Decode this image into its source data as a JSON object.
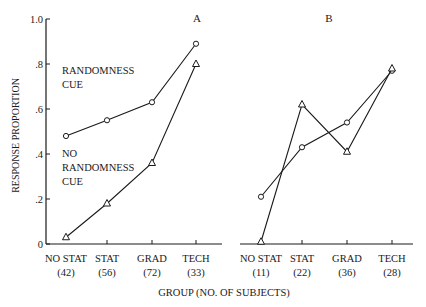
{
  "chart_data": [
    {
      "type": "line",
      "panel_label": "A",
      "categories": [
        "NO STAT",
        "STAT",
        "GRAD",
        "TECH"
      ],
      "category_counts": [
        "(42)",
        "(56)",
        "(72)",
        "(33)"
      ],
      "series": [
        {
          "name": "RANDOMNESS CUE",
          "marker": "circle",
          "values": [
            0.48,
            0.55,
            0.63,
            0.89
          ]
        },
        {
          "name": "NO RANDOMNESS CUE",
          "marker": "triangle",
          "values": [
            0.03,
            0.18,
            0.36,
            0.8
          ]
        }
      ],
      "ylabel": "RESPONSE PROPORTION",
      "yticks": [
        "0",
        ".2",
        ".4",
        ".6",
        ".8",
        "1.0"
      ],
      "ylim": [
        0,
        1.0
      ],
      "grid": false,
      "annotations": [
        {
          "text": [
            "RANDOMNESS",
            "CUE"
          ]
        },
        {
          "text": [
            "NO",
            "RANDOMNESS",
            "CUE"
          ]
        }
      ]
    },
    {
      "type": "line",
      "panel_label": "B",
      "categories": [
        "NO STAT",
        "STAT",
        "GRAD",
        "TECH"
      ],
      "category_counts": [
        "(11)",
        "(22)",
        "(36)",
        "(28)"
      ],
      "series": [
        {
          "name": "RANDOMNESS CUE",
          "marker": "circle",
          "values": [
            0.21,
            0.43,
            0.54,
            0.77
          ]
        },
        {
          "name": "NO RANDOMNESS CUE",
          "marker": "triangle",
          "values": [
            0.01,
            0.62,
            0.41,
            0.78
          ]
        }
      ],
      "ylim": [
        0,
        1.0
      ],
      "grid": false
    }
  ],
  "xlabel": "GROUP (NO. OF SUBJECTS)"
}
